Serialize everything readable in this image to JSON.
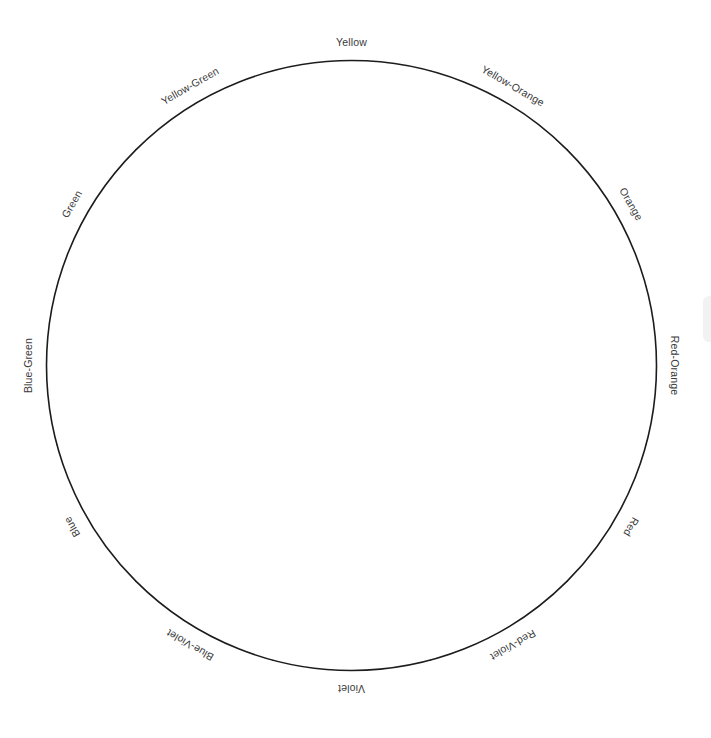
{
  "diagram": {
    "type": "color-wheel",
    "background_color": "#ffffff",
    "line_color": "#1c1c1c",
    "label_color": "#3a3a3a",
    "geometry": {
      "center_x": 351.5,
      "center_y": 365.5,
      "radius": 305,
      "label_radius": 322,
      "segment_count": 12,
      "segment_degrees": 30
    },
    "segments": [
      {
        "label": "Yellow",
        "angle": 0,
        "rotation": 0
      },
      {
        "label": "Yellow-Orange",
        "angle": 30,
        "rotation": 30
      },
      {
        "label": "Orange",
        "angle": 60,
        "rotation": 60
      },
      {
        "label": "Red-Orange",
        "angle": 90,
        "rotation": 90
      },
      {
        "label": "Red",
        "angle": 120,
        "rotation": 120
      },
      {
        "label": "Red-Violet",
        "angle": 150,
        "rotation": 150
      },
      {
        "label": "Violet",
        "angle": 180,
        "rotation": 180
      },
      {
        "label": "Blue-Violet",
        "angle": 210,
        "rotation": 210
      },
      {
        "label": "Blue",
        "angle": 240,
        "rotation": 240
      },
      {
        "label": "Blue-Green",
        "angle": 270,
        "rotation": 270
      },
      {
        "label": "Green",
        "angle": 300,
        "rotation": 300
      },
      {
        "label": "Yellow-Green",
        "angle": 330,
        "rotation": 330
      }
    ]
  }
}
